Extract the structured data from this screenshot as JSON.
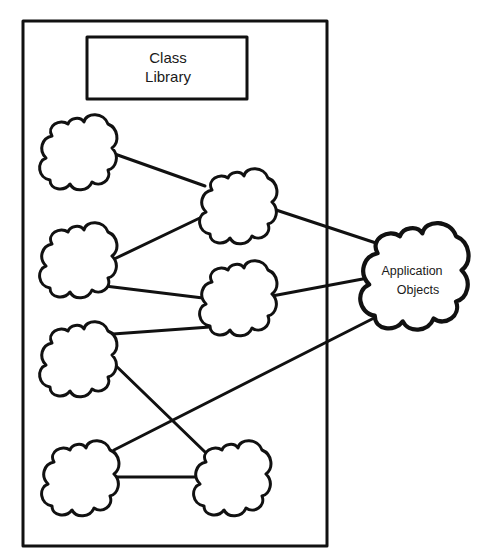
{
  "diagram": {
    "type": "class-library-to-application-objects",
    "container": {
      "label": "Class Library container"
    },
    "library_box": {
      "line1": "Class",
      "line2": "Library"
    },
    "application_objects": {
      "line1": "Application",
      "line2": "Objects"
    },
    "nodes": [
      {
        "id": "c1",
        "label": ""
      },
      {
        "id": "c2",
        "label": ""
      },
      {
        "id": "c3",
        "label": ""
      },
      {
        "id": "c4",
        "label": ""
      },
      {
        "id": "cA",
        "label": ""
      },
      {
        "id": "cB",
        "label": ""
      },
      {
        "id": "cC",
        "label": ""
      },
      {
        "id": "app",
        "label": "Application Objects"
      }
    ],
    "edges": [
      [
        "c1",
        "cA"
      ],
      [
        "c2",
        "cA"
      ],
      [
        "c2",
        "cB"
      ],
      [
        "c3",
        "cB"
      ],
      [
        "c3",
        "cC"
      ],
      [
        "c4",
        "cC"
      ],
      [
        "cA",
        "app"
      ],
      [
        "cB",
        "app"
      ],
      [
        "c4",
        "app"
      ]
    ],
    "colors": {
      "stroke": "#111111",
      "background": "#ffffff"
    }
  }
}
